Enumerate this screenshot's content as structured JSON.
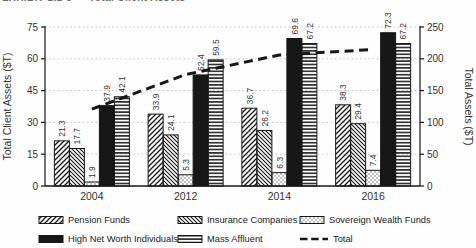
{
  "header": {
    "clipped_text": "EXHIBIT 2.1-3 — Total Client Assets"
  },
  "chart_data": {
    "type": "bar",
    "categories": [
      "2004",
      "2012",
      "2014",
      "2016"
    ],
    "series": [
      {
        "name": "Pension Funds",
        "pattern": "diag-forward",
        "values": [
          21.3,
          33.9,
          36.7,
          38.3
        ]
      },
      {
        "name": "Insurance Companies",
        "pattern": "diag-back",
        "values": [
          17.7,
          24.1,
          26.2,
          29.4
        ]
      },
      {
        "name": "Sovereign Wealth Funds",
        "pattern": "dots",
        "values": [
          1.9,
          5.3,
          6.3,
          7.4
        ]
      },
      {
        "name": "High Net Worth Individuals",
        "pattern": "solid",
        "values": [
          37.9,
          52.4,
          69.6,
          72.3
        ]
      },
      {
        "name": "Mass Affluent",
        "pattern": "hlines",
        "values": [
          42.1,
          59.5,
          67.2,
          67.2
        ]
      }
    ],
    "line_series": {
      "name": "Total",
      "axis": "right",
      "style": "dashed",
      "values": [
        120.9,
        175.2,
        206.0,
        214.6
      ]
    },
    "left_axis": {
      "label": "Total Client Assets ($T)",
      "min": 0,
      "max": 75,
      "ticks": [
        0,
        15,
        30,
        45,
        60,
        75
      ]
    },
    "right_axis": {
      "label": "Total Assets ($T)",
      "min": 0,
      "max": 250,
      "ticks": [
        0,
        50,
        100,
        150,
        200,
        250
      ]
    },
    "grid": true,
    "legend_position": "bottom",
    "value_labels": "rotated-90-above-bars",
    "colors": {
      "ink": "#171717",
      "text": "#333333",
      "grid": "#bdbdbd",
      "background": "#fefefe"
    }
  }
}
